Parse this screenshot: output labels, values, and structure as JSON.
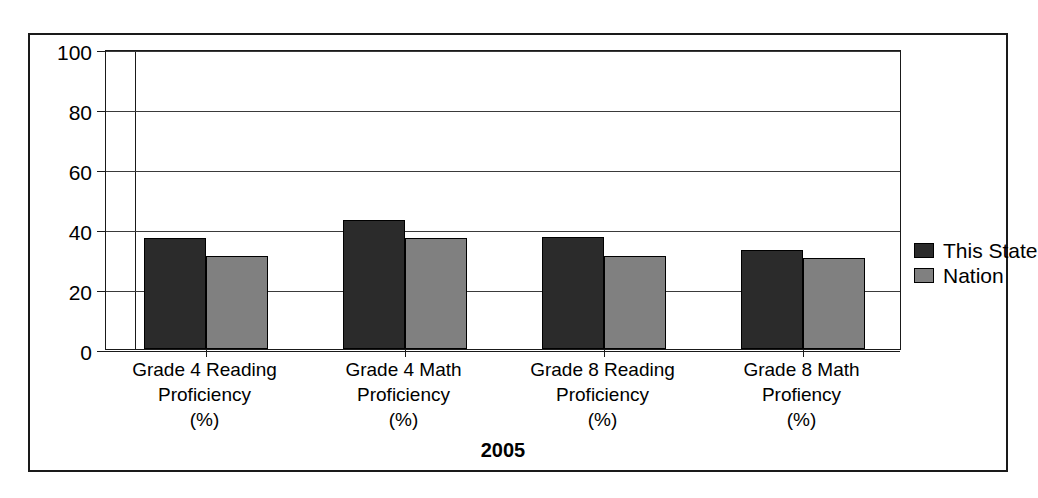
{
  "chart_data": {
    "type": "bar",
    "title": "",
    "xlabel": "2005",
    "ylabel": "",
    "ylim": [
      0,
      100
    ],
    "yticks": [
      0,
      20,
      40,
      60,
      80,
      100
    ],
    "grid": true,
    "legend_position": "right",
    "categories": [
      "Grade 4 Reading\nProficiency\n(%)",
      "Grade 4 Math\nProficiency\n(%)",
      "Grade 8 Reading\nProficiency\n(%)",
      "Grade 8 Math\nProfiency\n(%)"
    ],
    "category_lines": [
      [
        "Grade 4 Reading",
        "Proficiency",
        "(%)"
      ],
      [
        "Grade 4 Math",
        "Proficiency",
        "(%)"
      ],
      [
        "Grade 8 Reading",
        "Proficiency",
        "(%)"
      ],
      [
        "Grade 8 Math",
        "Profiency",
        "(%)"
      ]
    ],
    "series": [
      {
        "name": "This State",
        "color": "#2b2b2b",
        "values": [
          37,
          43,
          37.5,
          33
        ]
      },
      {
        "name": "Nation",
        "color": "#808080",
        "values": [
          31,
          37,
          31,
          30.5
        ]
      }
    ]
  },
  "legend": {
    "items": [
      {
        "label": "This State"
      },
      {
        "label": "Nation"
      }
    ]
  },
  "axis": {
    "title": "2005",
    "ytick_labels": [
      "100",
      "80",
      "60",
      "40",
      "20",
      "0"
    ]
  },
  "colors": {
    "state": "#2b2b2b",
    "nation": "#808080",
    "frame": "#1a1a1a",
    "background": "#ffffff"
  }
}
